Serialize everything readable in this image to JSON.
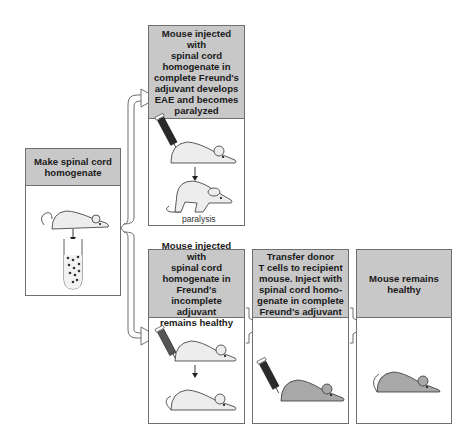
{
  "diagram": {
    "type": "experiment-flow",
    "colors": {
      "header_fill": "#c8c8c8",
      "border": "#6f6f6f",
      "healthy_mouse_fill": "#ededed",
      "protected_mouse_fill": "#a8a8a8",
      "syringe_fill": "#2a2a2a"
    },
    "panels": [
      {
        "id": "prepare",
        "header": "Make spinal cord\nhomogenate",
        "illustration": [
          "mouse",
          "arrow-down",
          "test-tube"
        ]
      },
      {
        "id": "complete-adjuvant",
        "header": "Mouse injected with\nspinal cord\nhomogenate in\ncomplete Freund's\nadjuvant develops\nEAE and becomes\nparalyzed",
        "illustration": [
          "syringe",
          "mouse",
          "arrow-down",
          "paralyzed-mouse"
        ],
        "caption": "paralysis"
      },
      {
        "id": "incomplete-adjuvant",
        "header": "Mouse injected with\nspinal cord\nhomogenate in\nFreund's incomplete\nadjuvant\nremains healthy",
        "illustration": [
          "syringe",
          "mouse",
          "arrow-down",
          "mouse"
        ]
      },
      {
        "id": "transfer",
        "header": "Transfer donor\nT cells to recipient\nmouse. Inject with\nspinal cord homo-\ngenate in complete\nFreund's adjuvant",
        "illustration": [
          "syringe",
          "gray-mouse"
        ]
      },
      {
        "id": "outcome",
        "header": "Mouse remains\nhealthy",
        "illustration": [
          "gray-mouse"
        ]
      }
    ],
    "connectors": [
      {
        "from": "prepare",
        "to": "complete-adjuvant",
        "style": "bracket-arrow"
      },
      {
        "from": "prepare",
        "to": "incomplete-adjuvant",
        "style": "bracket-arrow"
      },
      {
        "from": "incomplete-adjuvant",
        "to": "transfer",
        "style": "block-arrow"
      },
      {
        "from": "transfer",
        "to": "outcome",
        "style": "block-arrow"
      }
    ]
  }
}
